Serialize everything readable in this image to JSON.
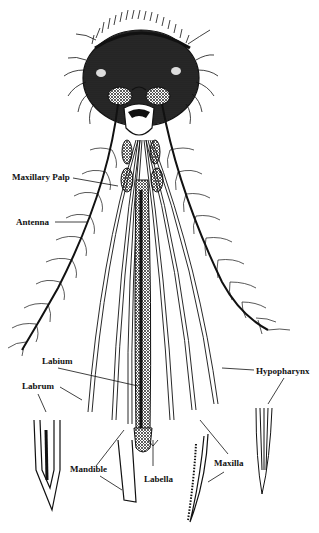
{
  "diagram": {
    "colors": {
      "ink": "#111111",
      "background": "#ffffff"
    },
    "labels": {
      "maxillary_palp": "Maxillary Palp",
      "antenna": "Antenna",
      "labium": "Labium",
      "labrum": "Labrum",
      "hypopharynx": "Hypopharynx",
      "mandible": "Mandible",
      "labella": "Labella",
      "maxilla": "Maxilla"
    }
  }
}
